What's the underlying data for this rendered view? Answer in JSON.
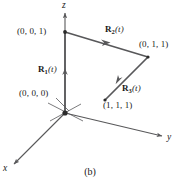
{
  "figure": {
    "caption": "(b)",
    "stroke_color": "#58585a",
    "text_color": "#1a1a1a",
    "background": "#ffffff",
    "axes": [
      {
        "name": "z",
        "label": "z",
        "from": [
          65,
          113
        ],
        "to": [
          65,
          12
        ]
      },
      {
        "name": "y",
        "label": "y",
        "from": [
          65,
          113
        ],
        "to": [
          163,
          136
        ]
      },
      {
        "name": "x",
        "label": "x",
        "from": [
          65,
          113
        ],
        "to": [
          13,
          165
        ]
      }
    ],
    "points": [
      {
        "name": "origin",
        "label": "(0, 0, 0)",
        "at": [
          65,
          113
        ]
      },
      {
        "name": "p001",
        "label": "(0, 0, 1)",
        "at": [
          65,
          32
        ]
      },
      {
        "name": "p011",
        "label": "(0, 1, 1)",
        "at": [
          148,
          57
        ]
      },
      {
        "name": "p111",
        "label": "(1, 1, 1)",
        "at": [
          105,
          100
        ]
      }
    ],
    "vectors": [
      {
        "name": "R1",
        "label_bold": "R",
        "label_sub": "1",
        "label_par": "(t)",
        "from": [
          65,
          113
        ],
        "to": [
          65,
          32
        ]
      },
      {
        "name": "R2",
        "label_bold": "R",
        "label_sub": "2",
        "label_par": "(t)",
        "from": [
          65,
          32
        ],
        "to": [
          148,
          57
        ]
      },
      {
        "name": "R3",
        "label_bold": "R",
        "label_sub": "3",
        "label_par": "(t)",
        "from": [
          148,
          57
        ],
        "to": [
          105,
          100
        ]
      }
    ],
    "leader_line": {
      "name": "origin-leader",
      "from": [
        57,
        99
      ],
      "to": [
        70,
        112
      ]
    },
    "tick_marks": [
      {
        "name": "tick-a",
        "from": [
          48,
          103
        ],
        "to": [
          82,
          121
        ]
      },
      {
        "name": "tick-b",
        "from": [
          50,
          120
        ],
        "to": [
          80,
          104
        ]
      }
    ]
  }
}
